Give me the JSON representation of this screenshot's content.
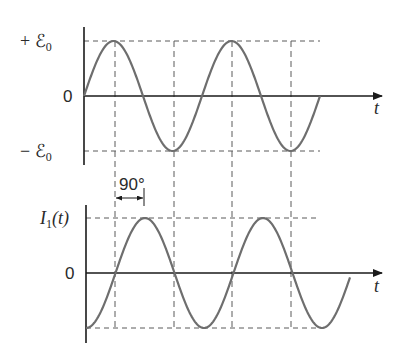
{
  "top_graph": {
    "y_label_pos": "+ ℰ",
    "y_label_pos_sub": "0",
    "y_label_zero": "0",
    "y_label_neg": "− ℰ",
    "y_label_neg_sub": "0",
    "x_label": "t",
    "curve": "sine",
    "description": "EMF source voltage over time, amplitude ℰ₀"
  },
  "bottom_graph": {
    "y_label": "I",
    "y_label_sub": "1",
    "y_label_suffix": "(t)",
    "y_label_zero": "0",
    "x_label": "t",
    "curve": "negative cosine",
    "description": "Current lagging EMF by 90 degrees"
  },
  "phase_marker": {
    "label": "90°"
  },
  "colors": {
    "axis": "#1a1a1a",
    "curve": "#6e6e6e",
    "dashed": "#5a5a5a",
    "background": "#ffffff"
  }
}
